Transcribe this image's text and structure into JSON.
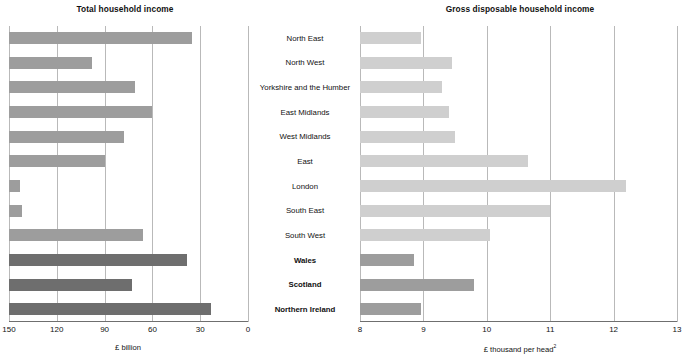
{
  "figure": {
    "panels": [
      {
        "id": "left",
        "title": "Total household income",
        "axis_title": "£ billion"
      },
      {
        "id": "right",
        "title": "Gross disposable household income",
        "axis_title": "£ thousand per head",
        "axis_title_footnote": "2"
      }
    ]
  },
  "categories": [
    {
      "label": "North East",
      "bold": false
    },
    {
      "label": "North West",
      "bold": false
    },
    {
      "label": "Yorkshire and the Humber",
      "bold": false
    },
    {
      "label": "East Midlands",
      "bold": false
    },
    {
      "label": "West Midlands",
      "bold": false
    },
    {
      "label": "East",
      "bold": false
    },
    {
      "label": "London",
      "bold": false
    },
    {
      "label": "South East",
      "bold": false
    },
    {
      "label": "South West",
      "bold": false
    },
    {
      "label": "Wales",
      "bold": true
    },
    {
      "label": "Scotland",
      "bold": true
    },
    {
      "label": "Northern Ireland",
      "bold": true
    }
  ],
  "colors": {
    "bar_light": "#cfcfcf",
    "bar_mid": "#9d9d9d",
    "bar_dark": "#6e6e6e",
    "gridline": "#b9b9b9",
    "axis": "#6f6f6f",
    "text": "#111111",
    "background": "#ffffff"
  },
  "chart_data": [
    {
      "type": "bar",
      "orientation": "horizontal",
      "id": "left",
      "title": "Total household income",
      "xlabel": "£ billion",
      "ylabel": "",
      "xlim": [
        150,
        0
      ],
      "reversed_x": true,
      "grid": true,
      "legend": "none",
      "xticks": [
        150,
        120,
        90,
        60,
        30,
        0
      ],
      "categories": [
        "North East",
        "North West",
        "Yorkshire and the Humber",
        "East Midlands",
        "West Midlands",
        "East",
        "London",
        "South East",
        "South West",
        "Wales",
        "Scotland",
        "Northern Ireland"
      ],
      "values": [
        35,
        98,
        71,
        60,
        78,
        90,
        143,
        142,
        66,
        38,
        73,
        23
      ],
      "bar_shades": [
        "mid",
        "mid",
        "mid",
        "mid",
        "mid",
        "mid",
        "mid",
        "mid",
        "mid",
        "dark",
        "dark",
        "dark"
      ]
    },
    {
      "type": "bar",
      "orientation": "horizontal",
      "id": "right",
      "title": "Gross disposable household income",
      "xlabel": "£ thousand per head",
      "ylabel": "",
      "xlim": [
        8,
        13
      ],
      "reversed_x": false,
      "grid": true,
      "legend": "none",
      "xticks": [
        8,
        9,
        10,
        11,
        12,
        13
      ],
      "categories": [
        "North East",
        "North West",
        "Yorkshire and the Humber",
        "East Midlands",
        "West Midlands",
        "East",
        "London",
        "South East",
        "South West",
        "Wales",
        "Scotland",
        "Northern Ireland"
      ],
      "values": [
        8.97,
        9.45,
        9.3,
        9.4,
        9.5,
        10.65,
        12.2,
        11.0,
        10.05,
        8.85,
        9.8,
        8.97
      ],
      "bar_shades": [
        "light",
        "light",
        "light",
        "light",
        "light",
        "light",
        "light",
        "light",
        "light",
        "mid",
        "mid",
        "mid"
      ]
    }
  ]
}
